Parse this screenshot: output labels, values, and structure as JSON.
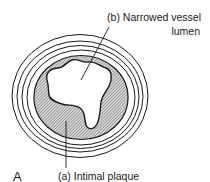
{
  "figure": {
    "panel_letter": "A",
    "labels": {
      "b_line1": "(b) Narrowed vessel",
      "b_line2": "lumen",
      "a": "(a) Intimal plaque"
    },
    "structures": [
      {
        "id": "a",
        "name": "Intimal plaque",
        "style": "diagonal hatching"
      },
      {
        "id": "b",
        "name": "Narrowed vessel lumen",
        "style": "white, irregular"
      }
    ],
    "vessel_wall_rings": 4,
    "colors": {
      "line": "#1a1a1a",
      "hatch": "#555555",
      "background": "#ffffff"
    }
  }
}
